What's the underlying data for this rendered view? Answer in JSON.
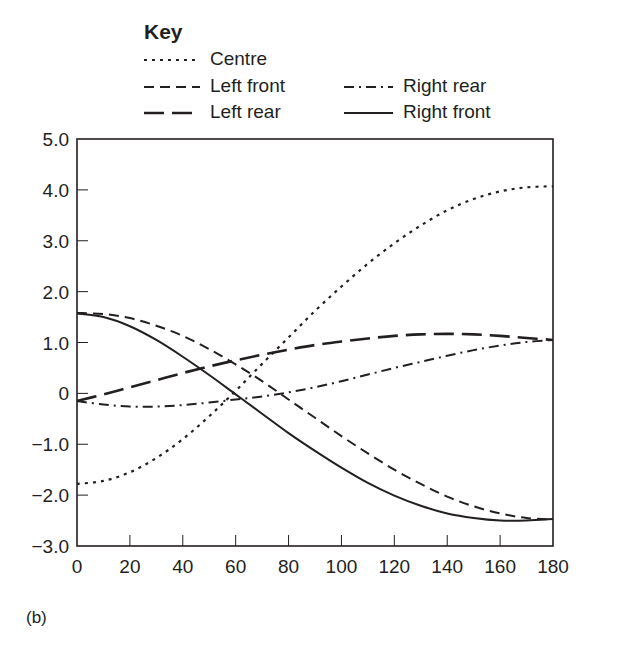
{
  "key": {
    "title": "Key",
    "items": [
      {
        "label": "Centre",
        "style": "dotted"
      },
      {
        "label": "Left front",
        "style": "dashed"
      },
      {
        "label": "Right rear",
        "style": "dash-dot"
      },
      {
        "label": "Left rear",
        "style": "long-dash"
      },
      {
        "label": "Right front",
        "style": "solid"
      }
    ]
  },
  "panel_label": "(b)",
  "chart_data": {
    "type": "line",
    "title": "",
    "xlabel": "",
    "ylabel": "",
    "xlim": [
      0,
      180
    ],
    "ylim": [
      -3.0,
      5.0
    ],
    "x_ticks": [
      0,
      20,
      40,
      60,
      80,
      100,
      120,
      140,
      160,
      180
    ],
    "y_ticks": [
      -3.0,
      -2.0,
      -1.0,
      0,
      1.0,
      2.0,
      3.0,
      4.0,
      5.0
    ],
    "y_tick_labels": [
      "-3.0",
      "-2.0",
      "-1.0",
      "0",
      "1.0",
      "2.0",
      "3.0",
      "4.0",
      "5.0"
    ],
    "grid": false,
    "legend_position": "top",
    "x": [
      0,
      10,
      20,
      30,
      40,
      50,
      60,
      70,
      80,
      90,
      100,
      110,
      120,
      130,
      140,
      150,
      160,
      170,
      180
    ],
    "series": [
      {
        "name": "Centre",
        "style": "dotted",
        "values": [
          -1.78,
          -1.72,
          -1.55,
          -1.27,
          -0.9,
          -0.45,
          0.05,
          0.58,
          1.1,
          1.62,
          2.1,
          2.55,
          2.95,
          3.3,
          3.6,
          3.82,
          3.97,
          4.05,
          4.07
        ]
      },
      {
        "name": "Left front",
        "style": "dashed",
        "values": [
          1.58,
          1.56,
          1.48,
          1.33,
          1.13,
          0.87,
          0.57,
          0.24,
          -0.12,
          -0.48,
          -0.84,
          -1.18,
          -1.5,
          -1.78,
          -2.03,
          -2.22,
          -2.36,
          -2.45,
          -2.48
        ]
      },
      {
        "name": "Right rear",
        "style": "dash-dot",
        "values": [
          -0.15,
          -0.22,
          -0.26,
          -0.26,
          -0.23,
          -0.18,
          -0.12,
          -0.06,
          0.02,
          0.12,
          0.24,
          0.37,
          0.5,
          0.62,
          0.74,
          0.85,
          0.94,
          1.01,
          1.05
        ]
      },
      {
        "name": "Left rear",
        "style": "long-dash",
        "values": [
          -0.15,
          -0.02,
          0.12,
          0.26,
          0.4,
          0.53,
          0.65,
          0.76,
          0.86,
          0.95,
          1.02,
          1.08,
          1.13,
          1.16,
          1.17,
          1.16,
          1.13,
          1.09,
          1.05
        ]
      },
      {
        "name": "Right front",
        "style": "solid",
        "values": [
          1.57,
          1.5,
          1.32,
          1.05,
          0.72,
          0.36,
          -0.02,
          -0.4,
          -0.78,
          -1.13,
          -1.46,
          -1.76,
          -2.01,
          -2.21,
          -2.36,
          -2.45,
          -2.5,
          -2.5,
          -2.47
        ]
      }
    ]
  }
}
